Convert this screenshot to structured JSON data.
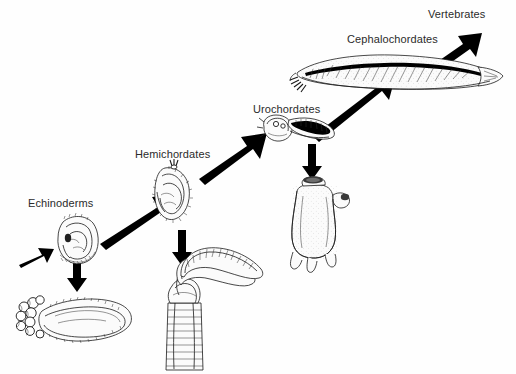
{
  "figure": {
    "background_color": "#fefefe",
    "ink_color": "#000000",
    "label_color": "#2b2b2b",
    "width": 516,
    "height": 374
  },
  "nodes": [
    {
      "id": "echinoderms",
      "label": "Echinoderms",
      "larva_organism": "echinoderm-bipinnaria-larva",
      "adult_organism": "sea-cucumber-holothurian"
    },
    {
      "id": "hemichordates",
      "label": "Hemichordates",
      "larva_organism": "hemichordate-tornaria-larva",
      "adult_organism": "pterobranch-hemichordate"
    },
    {
      "id": "urochordates",
      "label": "Urochordates",
      "larva_organism": "tunicate-tadpole-larva",
      "adult_organism": "sea-squirt-ascidian"
    },
    {
      "id": "cephalochordates",
      "label": "Cephalochordates",
      "larva_organism": "lancelet-amphioxus",
      "adult_organism": null
    },
    {
      "id": "vertebrates",
      "label": "Vertebrates",
      "larva_organism": null,
      "adult_organism": null
    }
  ],
  "arrows": [
    {
      "id": "arrow-origin-to-echinoderms",
      "kind": "lineage",
      "direction": "up-right",
      "size": "small"
    },
    {
      "id": "arrow-echinoderms-to-hemichordates",
      "kind": "lineage",
      "direction": "up-right",
      "size": "large"
    },
    {
      "id": "arrow-hemichordates-to-urochordates",
      "kind": "lineage",
      "direction": "up-right",
      "size": "large"
    },
    {
      "id": "arrow-urochordates-to-cephalochordates",
      "kind": "lineage",
      "direction": "up-right",
      "size": "large"
    },
    {
      "id": "arrow-cephalochordates-to-vertebrates",
      "kind": "lineage",
      "direction": "up-right",
      "size": "small"
    },
    {
      "id": "arrow-echinoderm-larva-to-adult",
      "kind": "development",
      "direction": "down",
      "size": "medium"
    },
    {
      "id": "arrow-hemichordate-larva-to-adult",
      "kind": "development",
      "direction": "down",
      "size": "medium"
    },
    {
      "id": "arrow-urochordate-larva-to-adult",
      "kind": "development",
      "direction": "down",
      "size": "medium"
    }
  ]
}
